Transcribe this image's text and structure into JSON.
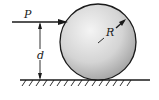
{
  "diagram": {
    "type": "physics-free-body",
    "labels": {
      "force": "P",
      "height": "d",
      "radius": "R"
    },
    "colors": {
      "stroke": "#1a1a1a",
      "ball_light": "#f2f2f2",
      "ball_dark": "#a8a8a8",
      "background": "#ffffff"
    }
  }
}
